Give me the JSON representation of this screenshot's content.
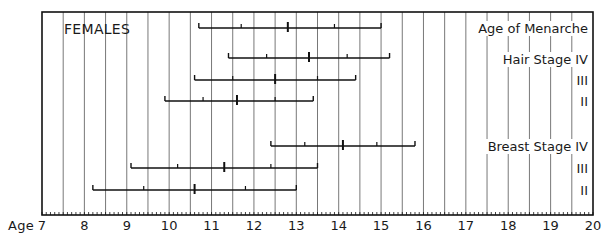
{
  "chart_data": {
    "type": "range",
    "title": "FEMALES",
    "xlabel": "Age",
    "xlim": [
      7,
      20
    ],
    "x_ticks": [
      7,
      8,
      9,
      10,
      11,
      12,
      13,
      14,
      15,
      16,
      17,
      18,
      19,
      20
    ],
    "minor_tick_step": 0.1,
    "grid": "vertical lines every 0.5 year",
    "legend": "none",
    "series_format": "whisker: [low, low_mid, median, high_mid, high]",
    "groups": [
      {
        "name": "Age of Menarche",
        "rows": [
          {
            "label": "Age of Menarche",
            "values": [
              10.7,
              11.7,
              12.8,
              13.9,
              15.0
            ]
          }
        ]
      },
      {
        "name": "Hair Stage",
        "rows": [
          {
            "label": "IV",
            "values": [
              11.4,
              12.3,
              13.3,
              14.2,
              15.2
            ]
          },
          {
            "label": "III",
            "values": [
              10.6,
              11.5,
              12.5,
              13.5,
              14.4
            ]
          },
          {
            "label": "II",
            "values": [
              9.9,
              10.8,
              11.6,
              12.5,
              13.4
            ]
          }
        ]
      },
      {
        "name": "Breast Stage",
        "rows": [
          {
            "label": "IV",
            "values": [
              12.4,
              13.2,
              14.1,
              14.9,
              15.8
            ]
          },
          {
            "label": "III",
            "values": [
              9.1,
              10.2,
              11.3,
              12.4,
              13.5
            ]
          },
          {
            "label": "II",
            "values": [
              8.2,
              9.4,
              10.6,
              11.8,
              13.0
            ]
          }
        ]
      }
    ]
  },
  "labels": {
    "panel_title": "FEMALES",
    "axis_prefix": "Age",
    "menarche": "Age of Menarche",
    "hair_iv": "Hair Stage IV",
    "hair_iii": "III",
    "hair_ii": "II",
    "breast_iv": "Breast Stage IV",
    "breast_iii": "III",
    "breast_ii": "II"
  },
  "ticks": [
    "7",
    "8",
    "9",
    "10",
    "11",
    "12",
    "13",
    "14",
    "15",
    "16",
    "17",
    "18",
    "19",
    "20"
  ]
}
